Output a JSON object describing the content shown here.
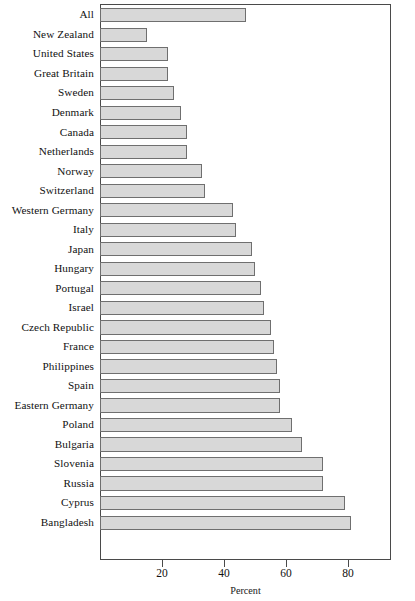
{
  "chart_data": {
    "type": "bar",
    "orientation": "horizontal",
    "title": "",
    "xlabel": "Percent",
    "ylabel": "",
    "xlim": [
      0,
      94
    ],
    "xticks": [
      20,
      40,
      60,
      80
    ],
    "grid": false,
    "legend": null,
    "categories": [
      "All",
      "New Zealand",
      "United States",
      "Great Britain",
      "Sweden",
      "Denmark",
      "Canada",
      "Netherlands",
      "Norway",
      "Switzerland",
      "Western Germany",
      "Italy",
      "Japan",
      "Hungary",
      "Portugal",
      "Israel",
      "Czech Republic",
      "France",
      "Philippines",
      "Spain",
      "Eastern Germany",
      "Poland",
      "Bulgaria",
      "Slovenia",
      "Russia",
      "Cyprus",
      "Bangladesh"
    ],
    "values": [
      47,
      15,
      22,
      22,
      24,
      26,
      28,
      28,
      33,
      34,
      43,
      44,
      49,
      50,
      52,
      53,
      55,
      56,
      57,
      58,
      58,
      62,
      65,
      72,
      72,
      79,
      81
    ],
    "bar_fill_color": "#d8d8d8",
    "bar_border_color": "#6f6f6f",
    "axis_color": "#4a4a4a"
  }
}
